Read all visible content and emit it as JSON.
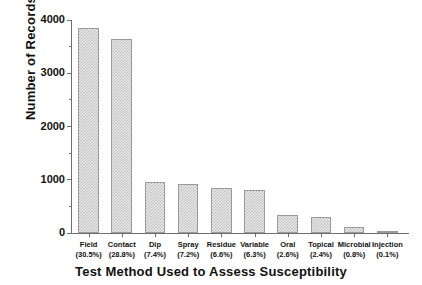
{
  "chart_data": {
    "type": "bar",
    "title": "",
    "xlabel": "Test Method Used to Assess Susceptibility",
    "ylabel": "Number of Records",
    "categories": [
      "Field",
      "Contact",
      "Dip",
      "Spray",
      "Residue",
      "Variable",
      "Oral",
      "Topical",
      "Microbial",
      "Injection"
    ],
    "percent_labels": [
      "(30.5%)",
      "(28.8%)",
      "(7.4%)",
      "(7.2%)",
      "(6.6%)",
      "(6.3%)",
      "(2.6%)",
      "(2.4%)",
      "(0.8%)",
      "(0.1%)"
    ],
    "percents": [
      30.5,
      28.8,
      7.4,
      7.2,
      6.6,
      6.3,
      2.6,
      2.4,
      0.8,
      0.1
    ],
    "values": [
      3850,
      3640,
      950,
      920,
      850,
      800,
      340,
      310,
      110,
      15
    ],
    "ylim": [
      0,
      4000
    ],
    "yticks": [
      0,
      1000,
      2000,
      3000,
      4000
    ],
    "ytick_labels": [
      "0",
      "1000",
      "2000",
      "3000",
      "4000"
    ],
    "yminor_ticks": [
      500,
      1500,
      2500,
      3500
    ],
    "grid": false,
    "legend": null,
    "bar_edge_color": "#9a9a9a",
    "bar_fill_color": "#d7d7d7",
    "axis_color": "#6e6e6e"
  }
}
